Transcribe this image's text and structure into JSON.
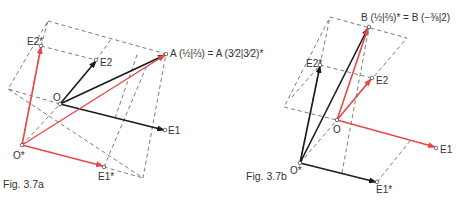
{
  "colors": {
    "red": "#e8474b",
    "black": "#1a1a1a",
    "dash": "#444444"
  },
  "fig_a": {
    "caption": "Fig. 3.7a",
    "labels": {
      "O": "O",
      "O_star": "O*",
      "E1": "E1",
      "E2": "E2",
      "E1_star": "E1*",
      "E2_star": "E2*",
      "A": "A (½|⅔) = A (3⁄2|3⁄2)*"
    }
  },
  "fig_b": {
    "caption": "Fig. 3.7b",
    "labels": {
      "O": "O",
      "O_star": "O*",
      "E1": "E1",
      "E2": "E2",
      "E1_star": "E1*",
      "E2_star": "E2*",
      "B": "B (½|⅔)* = B (−⅜|2)"
    }
  }
}
